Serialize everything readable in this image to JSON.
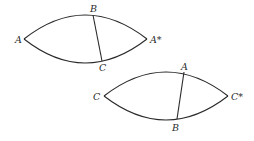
{
  "diagram": {
    "type": "spherical-triangle-lunes",
    "stroke_color": "#2a2a2a",
    "background": "#ffffff",
    "lunes": [
      {
        "id": "lune-top",
        "left_vertex": {
          "label": "A",
          "x": 24,
          "y": 39
        },
        "right_vertex": {
          "label": "A*",
          "x": 147,
          "y": 39
        },
        "top_arc_peak_y": 14,
        "bottom_arc_low_y": 63,
        "chord": {
          "top": {
            "label": "B",
            "x": 93,
            "y": 15
          },
          "bottom": {
            "label": "C",
            "x": 102,
            "y": 61
          }
        }
      },
      {
        "id": "lune-bottom",
        "left_vertex": {
          "label": "C",
          "x": 104,
          "y": 96
        },
        "right_vertex": {
          "label": "C*",
          "x": 228,
          "y": 96
        },
        "top_arc_peak_y": 71,
        "bottom_arc_low_y": 120,
        "chord": {
          "top": {
            "label": "A",
            "x": 184,
            "y": 72
          },
          "bottom": {
            "label": "B",
            "x": 177,
            "y": 119
          }
        }
      }
    ]
  },
  "labels": {
    "lune1_left": "A",
    "lune1_right": "A*",
    "lune1_top": "B",
    "lune1_bottom": "C",
    "lune2_left": "C",
    "lune2_right": "C*",
    "lune2_top": "A",
    "lune2_bottom": "B"
  }
}
